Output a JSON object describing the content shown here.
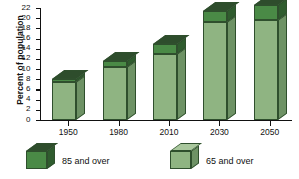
{
  "chart_data": {
    "type": "bar",
    "title": "",
    "xlabel": "",
    "ylabel": "Percent of population",
    "ylim": [
      0,
      22
    ],
    "yticks": [
      0,
      2,
      4,
      6,
      8,
      10,
      12,
      14,
      16,
      18,
      20,
      22
    ],
    "ytick_labels": [
      "0",
      "2",
      "4",
      "6",
      "8",
      "10",
      "12",
      "14",
      "16",
      "18",
      "20",
      "22"
    ],
    "grid": false,
    "stacked": true,
    "legend_position": "bottom",
    "categories": [
      "1950",
      "1980",
      "2010",
      "2030",
      "2050"
    ],
    "series": [
      {
        "name": "65 and over",
        "color": "#8fb482",
        "values": [
          7.5,
          10.5,
          13.0,
          19.3,
          19.6
        ]
      },
      {
        "name": "85 and over",
        "color": "#4a8a46",
        "values": [
          0.5,
          1.1,
          2.0,
          2.2,
          3.0
        ]
      }
    ],
    "totals": [
      8.0,
      11.6,
      15.0,
      21.5,
      22.6
    ]
  },
  "axes": {
    "y_title": "Percent of population"
  },
  "legend": {
    "items": [
      {
        "label": "85 and over",
        "swatch": "dark-green-cube"
      },
      {
        "label": "65 and over",
        "swatch": "light-green-cube"
      }
    ]
  },
  "colors": {
    "light_front": "#8fb482",
    "light_side": "#6e9265",
    "light_top": "#a9c79d",
    "dark_front": "#4a8a46",
    "dark_side": "#2f5c2e",
    "dark_top": "#2e4d2c",
    "axis": "#111111",
    "background": "#ffffff"
  }
}
